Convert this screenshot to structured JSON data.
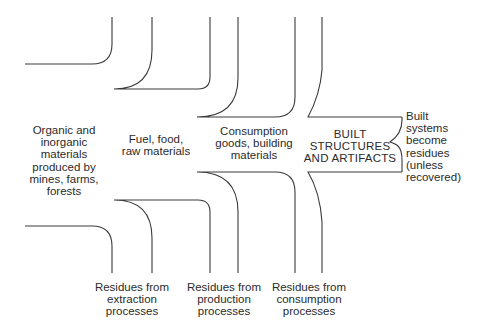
{
  "diagram": {
    "type": "flow-of-materials",
    "stages": [
      {
        "id": "extraction",
        "lines": [
          "Organic and",
          "inorganic",
          "materials",
          "produced by",
          "mines, farms,",
          "forests"
        ]
      },
      {
        "id": "production",
        "lines": [
          "Fuel, food,",
          "raw materials"
        ]
      },
      {
        "id": "consumption",
        "lines": [
          "Consumption",
          "goods, building",
          "materials"
        ]
      },
      {
        "id": "built",
        "lines": [
          "BUILT",
          "STRUCTURES",
          "AND ARTIFACTS"
        ]
      }
    ],
    "residues": [
      {
        "id": "extraction-residues",
        "lines": [
          "Residues from",
          "extraction",
          "processes"
        ]
      },
      {
        "id": "production-residues",
        "lines": [
          "Residues from",
          "production",
          "processes"
        ]
      },
      {
        "id": "consumption-residues",
        "lines": [
          "Residues from",
          "consumption",
          "processes"
        ]
      }
    ],
    "annotation": {
      "lines": [
        "Built",
        "systems",
        "become",
        "residues",
        "(unless",
        "recovered)"
      ]
    },
    "colors": {
      "line": "#3a3a3a",
      "text": "#2b2b2b",
      "background": "#ffffff"
    }
  }
}
